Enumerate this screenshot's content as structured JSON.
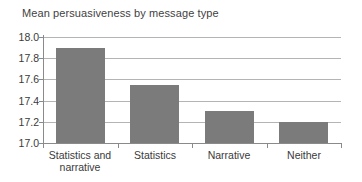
{
  "chart_data": {
    "type": "bar",
    "title": "Mean persuasiveness by message type",
    "categories": [
      "Statistics and\nnarrative",
      "Statistics",
      "Narrative",
      "Neither"
    ],
    "values": [
      17.9,
      17.55,
      17.3,
      17.2
    ],
    "xlabel": "",
    "ylabel": "",
    "ylim": [
      17.0,
      18.0
    ],
    "ytick_step": 0.2,
    "ytick_labels": [
      "17.0",
      "17.2",
      "17.4",
      "17.6",
      "17.8",
      "18.0"
    ],
    "grid": true,
    "legend": "none",
    "colors": {
      "bar": "#7b7b7b",
      "gridline": "#b4b4b4",
      "axis": "#8a8a8a",
      "text": "#3a3a3a",
      "background": "#ffffff"
    }
  }
}
